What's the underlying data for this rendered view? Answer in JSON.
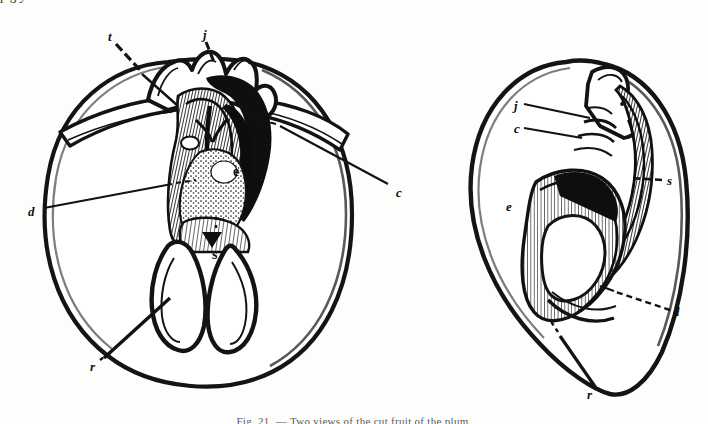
{
  "page": {
    "kind": "engraving-plate",
    "width": 708,
    "height": 424,
    "background_color": "#fdfdfc",
    "ink_color": "#111010"
  },
  "top_bleed": {
    "text": "p g y"
  },
  "caption": {
    "text": "Fig. 21. — Two views of the cut fruit of the plum."
  },
  "figures": [
    {
      "id": "left-figure",
      "name": "transverse-section-figure",
      "labels": [
        {
          "key": "t",
          "text": "t",
          "x": 108,
          "y": 30
        },
        {
          "key": "j",
          "text": "j",
          "x": 203,
          "y": 28
        },
        {
          "key": "c",
          "text": "c",
          "x": 396,
          "y": 186
        },
        {
          "key": "d",
          "text": "d",
          "x": 28,
          "y": 205
        },
        {
          "key": "e",
          "text": "e",
          "x": 233,
          "y": 172
        },
        {
          "key": "s",
          "text": "s",
          "x": 215,
          "y": 254
        },
        {
          "key": "r",
          "text": "r",
          "x": 92,
          "y": 364
        }
      ]
    },
    {
      "id": "right-figure",
      "name": "longitudinal-section-figure",
      "labels": [
        {
          "key": "j",
          "text": "j",
          "x": 516,
          "y": 106
        },
        {
          "key": "c",
          "text": "c",
          "x": 516,
          "y": 129
        },
        {
          "key": "s",
          "text": "s",
          "x": 669,
          "y": 181
        },
        {
          "key": "e",
          "text": "e",
          "x": 508,
          "y": 207
        },
        {
          "key": "d",
          "text": "d",
          "x": 675,
          "y": 312
        },
        {
          "key": "r",
          "text": "r",
          "x": 589,
          "y": 393
        }
      ]
    }
  ]
}
